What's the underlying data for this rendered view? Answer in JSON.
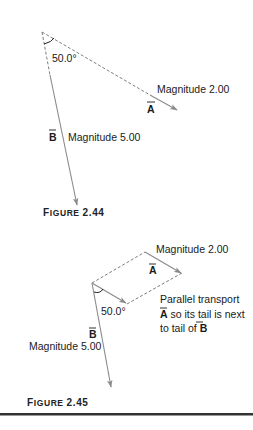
{
  "figures": [
    {
      "caption_first": "F",
      "caption_rest": "IGURE",
      "caption_number": "2.44",
      "angle_label": "50.0°",
      "vector_a": {
        "symbol": "A",
        "magnitude_label": "Magnitude 2.00"
      },
      "vector_b": {
        "symbol": "B",
        "magnitude_label": "Magnitude 5.00"
      }
    },
    {
      "caption_first": "F",
      "caption_rest": "IGURE",
      "caption_number": "2.45",
      "angle_label": "50.0°",
      "vector_a": {
        "symbol": "A",
        "magnitude_label": "Magnitude 2.00"
      },
      "vector_b": {
        "symbol": "B",
        "magnitude_label": "Magnitude 5.00"
      },
      "note": {
        "line1": "Parallel transport",
        "line2_symbol": "A",
        "line2_text": " so its tail is next",
        "line3_text": "to tail of ",
        "line3_symbol": "B"
      }
    }
  ],
  "colors": {
    "vector_line": "#8a8a8a",
    "dashed_line": "#6e6e6e",
    "text": "#1a1a1a",
    "rule": "#333333"
  }
}
